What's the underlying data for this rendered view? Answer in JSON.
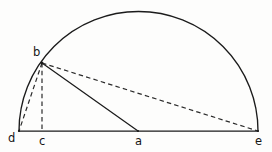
{
  "figure": {
    "type": "geometry-diagram",
    "background_color": "#fdfdfc",
    "stroke_color": "#1b1b1b",
    "dash_color": "#2a2a2a",
    "points": {
      "a": {
        "label": "a",
        "x": 138,
        "y": 131,
        "role": "centre-of-semicircle"
      },
      "b": {
        "label": "b",
        "x": 42,
        "y": 63,
        "role": "point-on-arc"
      },
      "c": {
        "label": "c",
        "x": 42,
        "y": 131,
        "role": "foot-of-perpendicular"
      },
      "d": {
        "label": "d",
        "x": 19,
        "y": 131,
        "role": "left-end-of-diameter"
      },
      "e": {
        "label": "e",
        "x": 258,
        "y": 131,
        "role": "right-end-of-diameter"
      }
    },
    "arc": {
      "centre_x": 138,
      "centre_y": 131,
      "radius": 119.5,
      "start_x": 19,
      "start_y": 131,
      "end_x": 258,
      "end_y": 131,
      "style": "solid"
    },
    "segments": [
      {
        "name": "diameter-d-e",
        "from": "d",
        "to": "e",
        "style": "solid"
      },
      {
        "name": "radius-b-a",
        "from": "b",
        "to": "a",
        "style": "solid"
      },
      {
        "name": "chord-b-d",
        "from": "b",
        "to": "d",
        "style": "dashed"
      },
      {
        "name": "chord-b-e",
        "from": "b",
        "to": "e",
        "style": "dashed"
      },
      {
        "name": "altitude-b-c",
        "from": "b",
        "to": "c",
        "style": "dashed"
      }
    ]
  }
}
